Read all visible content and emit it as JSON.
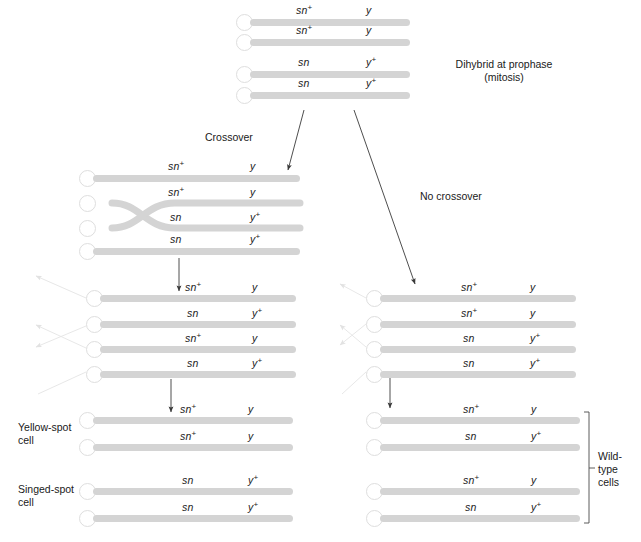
{
  "figure": {
    "colors": {
      "chromatid": "#d4d4d4",
      "chromatid_dark": "#cbcbcb",
      "centromere_fill": "#ffffff",
      "centromere_stroke": "#dedede",
      "text": "#1a1a1a",
      "arrow": "#3a3a3a",
      "ghost_arrow": "#e4e4e4",
      "bracket": "#4a4a4a",
      "background": "#ffffff"
    }
  },
  "labels": {
    "dihybrid": "Dihybrid at prophase\n(mitosis)",
    "crossover": "Crossover",
    "no_crossover": "No crossover",
    "yellow_spot_cell": "Yellow-spot\ncell",
    "singed_spot_cell": "Singed-spot\ncell",
    "wild_type_cells": "Wild-\ntype\ncells"
  },
  "alleles": {
    "sn_plus": "sn",
    "sn": "sn",
    "y_plus": "y",
    "y": "y",
    "plus": "+"
  },
  "groups": {
    "top": {
      "name": "dihybrid-prophase-chromosomes",
      "chromatids": [
        {
          "left": "sn+",
          "right": "y"
        },
        {
          "left": "sn+",
          "right": "y"
        },
        {
          "left": "sn",
          "right": "y+"
        },
        {
          "left": "sn",
          "right": "y+"
        }
      ]
    },
    "crossover_prophase": {
      "name": "crossover-chromosomes",
      "chromatids": [
        {
          "left": "sn+",
          "right": "y"
        },
        {
          "left": "sn+",
          "right": "y"
        },
        {
          "left": "sn",
          "right": "y+"
        },
        {
          "left": "sn",
          "right": "y+"
        }
      ]
    },
    "crossover_anaphase": {
      "name": "crossover-recombinant-chromosomes",
      "chromatids": [
        {
          "left": "sn+",
          "right": "y"
        },
        {
          "left": "sn",
          "right": "y+"
        },
        {
          "left": "sn+",
          "right": "y"
        },
        {
          "left": "sn",
          "right": "y+"
        }
      ]
    },
    "yellow_spot": {
      "name": "yellow-spot-cell-chromosomes",
      "chromatids": [
        {
          "left": "sn+",
          "right": "y"
        },
        {
          "left": "sn+",
          "right": "y"
        }
      ]
    },
    "singed_spot": {
      "name": "singed-spot-cell-chromosomes",
      "chromatids": [
        {
          "left": "sn",
          "right": "y+"
        },
        {
          "left": "sn",
          "right": "y+"
        }
      ]
    },
    "no_crossover_prophase": {
      "name": "no-crossover-chromosomes",
      "chromatids": [
        {
          "left": "sn+",
          "right": "y"
        },
        {
          "left": "sn+",
          "right": "y"
        },
        {
          "left": "sn",
          "right": "y+"
        },
        {
          "left": "sn",
          "right": "y+"
        }
      ]
    },
    "wild_type_upper": {
      "name": "wild-type-cell-upper-chromosomes",
      "chromatids": [
        {
          "left": "sn+",
          "right": "y"
        },
        {
          "left": "sn",
          "right": "y+"
        }
      ]
    },
    "wild_type_lower": {
      "name": "wild-type-cell-lower-chromosomes",
      "chromatids": [
        {
          "left": "sn+",
          "right": "y"
        },
        {
          "left": "sn",
          "right": "y+"
        }
      ]
    }
  }
}
